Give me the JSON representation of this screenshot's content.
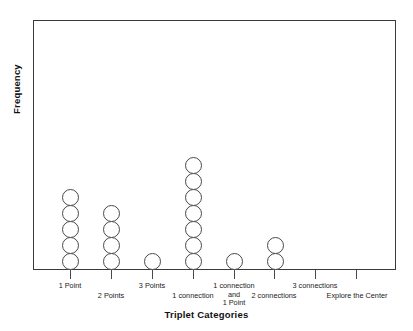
{
  "chart_data": {
    "type": "bar",
    "plot_style": "dot-plot",
    "title": "",
    "xlabel": "Triplet Categories",
    "ylabel": "Frequency",
    "categories": [
      "1 Point",
      "2 Points",
      "3 Points",
      "1 connection",
      "1 connection and 1 Point",
      "2 connections",
      "3 connections",
      "Explore the Center"
    ],
    "values": [
      5,
      4,
      1,
      7,
      1,
      2,
      0,
      0
    ],
    "ylim": [
      0,
      9
    ],
    "xtick_labels": [
      "1 Point",
      "2 Points",
      "3 Points",
      "1 connection",
      "1 connection and 1 Point",
      "2 connections",
      "3 connections",
      "Explore the Center"
    ],
    "ytick_labels": [],
    "grid": false,
    "legend": null,
    "annotations": [],
    "marker": "open-circle",
    "colors": {
      "marker_stroke": "#4a4a4a",
      "marker_fill": "#ffffff",
      "frame": "#3a3a3a",
      "text": "#111111",
      "background": "#ffffff"
    }
  },
  "labels": {
    "row_upper": [
      {
        "text": "1 Point",
        "x": 70
      },
      {
        "text": "3 Points",
        "x": 152
      },
      {
        "text": "1 connection",
        "x": 234
      },
      {
        "text": "3 connections",
        "x": 315
      }
    ],
    "row_lower": [
      {
        "text": "2 Points",
        "x": 111
      },
      {
        "text": "1 connection",
        "x": 193
      },
      {
        "text": "2 connections",
        "x": 274
      },
      {
        "text": "Explore the Center",
        "x": 356
      }
    ],
    "wrapped_extra": [
      "and",
      "1 Point"
    ]
  }
}
